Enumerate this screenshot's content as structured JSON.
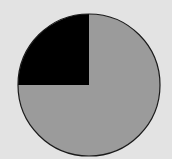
{
  "chart_data": {
    "type": "pie",
    "title": "",
    "categories": [
      "Slice A",
      "Slice B"
    ],
    "values": [
      25,
      75
    ],
    "colors": [
      "#000000",
      "#9b9b9b"
    ],
    "start_angle_deg": 270,
    "direction": "counterclockwise-from-top-left",
    "legend": "none",
    "labels_shown": false
  },
  "style": {
    "background": "#e3e3e3",
    "outline": "#1a1a1a",
    "center": [
      89,
      85
    ],
    "radius": 71
  }
}
